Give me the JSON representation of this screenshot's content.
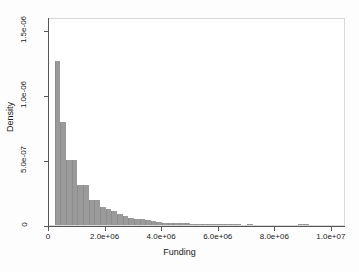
{
  "chart_data": {
    "type": "bar",
    "title": "",
    "subtitle": "",
    "xlabel": "Funding",
    "ylabel": "Density",
    "xlim": [
      0,
      10500000
    ],
    "ylim": [
      0,
      1.6e-06
    ],
    "grid": false,
    "legend": null,
    "bin_width": 200000,
    "bar_color": "#9a9a9a",
    "xticks": [
      {
        "value": 0,
        "label": "0"
      },
      {
        "value": 2000000,
        "label": "2.0e+06"
      },
      {
        "value": 4000000,
        "label": "4.0e+06"
      },
      {
        "value": 6000000,
        "label": "6.0e+06"
      },
      {
        "value": 8000000,
        "label": "8.0e+06"
      },
      {
        "value": 10000000,
        "label": "1.0e+07"
      }
    ],
    "yticks": [
      {
        "value": 0,
        "label": "0"
      },
      {
        "value": 5e-07,
        "label": "5.0e-07"
      },
      {
        "value": 1e-06,
        "label": "1.0e-06"
      },
      {
        "value": 1.5e-06,
        "label": "1.5e-06"
      }
    ],
    "bins": [
      {
        "x0": 200000,
        "x1": 400000,
        "density": 1.26e-06
      },
      {
        "x0": 400000,
        "x1": 600000,
        "density": 7.9e-07
      },
      {
        "x0": 600000,
        "x1": 800000,
        "density": 5e-07
      },
      {
        "x0": 800000,
        "x1": 1000000,
        "density": 5e-07
      },
      {
        "x0": 1000000,
        "x1": 1200000,
        "density": 3.1e-07
      },
      {
        "x0": 1200000,
        "x1": 1400000,
        "density": 3.1e-07
      },
      {
        "x0": 1400000,
        "x1": 1600000,
        "density": 1.9e-07
      },
      {
        "x0": 1600000,
        "x1": 1800000,
        "density": 1.9e-07
      },
      {
        "x0": 1800000,
        "x1": 2000000,
        "density": 1.35e-07
      },
      {
        "x0": 2000000,
        "x1": 2200000,
        "density": 1.2e-07
      },
      {
        "x0": 2200000,
        "x1": 2400000,
        "density": 1.05e-07
      },
      {
        "x0": 2400000,
        "x1": 2600000,
        "density": 8.5e-08
      },
      {
        "x0": 2600000,
        "x1": 2800000,
        "density": 7e-08
      },
      {
        "x0": 2800000,
        "x1": 3000000,
        "density": 5.5e-08
      },
      {
        "x0": 3000000,
        "x1": 3200000,
        "density": 4.5e-08
      },
      {
        "x0": 3200000,
        "x1": 3400000,
        "density": 4.5e-08
      },
      {
        "x0": 3400000,
        "x1": 3600000,
        "density": 3.5e-08
      },
      {
        "x0": 3600000,
        "x1": 3800000,
        "density": 3e-08
      },
      {
        "x0": 3800000,
        "x1": 4000000,
        "density": 2.5e-08
      },
      {
        "x0": 4000000,
        "x1": 4200000,
        "density": 1.8e-08
      },
      {
        "x0": 4200000,
        "x1": 4400000,
        "density": 1.5e-08
      },
      {
        "x0": 4400000,
        "x1": 4600000,
        "density": 1.2e-08
      },
      {
        "x0": 4600000,
        "x1": 4800000,
        "density": 1.5e-08
      },
      {
        "x0": 4800000,
        "x1": 5000000,
        "density": 1.5e-08
      },
      {
        "x0": 5000000,
        "x1": 5200000,
        "density": 1e-08
      },
      {
        "x0": 5200000,
        "x1": 5400000,
        "density": 7e-09
      },
      {
        "x0": 5400000,
        "x1": 5600000,
        "density": 6e-09
      },
      {
        "x0": 5600000,
        "x1": 5800000,
        "density": 5e-09
      },
      {
        "x0": 5800000,
        "x1": 6000000,
        "density": 6e-09
      },
      {
        "x0": 6000000,
        "x1": 6200000,
        "density": 5e-09
      },
      {
        "x0": 6200000,
        "x1": 6400000,
        "density": 4e-09
      },
      {
        "x0": 6400000,
        "x1": 6600000,
        "density": 5e-09
      },
      {
        "x0": 6600000,
        "x1": 6800000,
        "density": 4e-09
      },
      {
        "x0": 6800000,
        "x1": 7000000,
        "density": 3e-09
      },
      {
        "x0": 7000000,
        "x1": 7200000,
        "density": 4e-09
      },
      {
        "x0": 7400000,
        "x1": 7600000,
        "density": 3e-09
      },
      {
        "x0": 7800000,
        "x1": 8000000,
        "density": 3e-09
      },
      {
        "x0": 8200000,
        "x1": 8400000,
        "density": 3e-09
      },
      {
        "x0": 8600000,
        "x1": 8800000,
        "density": 3e-09
      },
      {
        "x0": 8800000,
        "x1": 9000000,
        "density": 6e-09
      },
      {
        "x0": 9000000,
        "x1": 9200000,
        "density": 5e-09
      },
      {
        "x0": 9600000,
        "x1": 9800000,
        "density": 3e-09
      },
      {
        "x0": 10000000,
        "x1": 10200000,
        "density": 3e-09
      }
    ]
  }
}
